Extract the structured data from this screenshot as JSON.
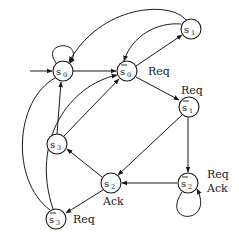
{
  "diagram": {
    "type": "state-transition-graph",
    "nodes": [
      {
        "id": "s0",
        "base": "s",
        "sub": "0",
        "bar": false,
        "x": 63,
        "y": 71
      },
      {
        "id": "s0bar",
        "base": "s",
        "sub": "0",
        "bar": true,
        "x": 127,
        "y": 71
      },
      {
        "id": "s1",
        "base": "s",
        "sub": "1",
        "bar": false,
        "x": 191,
        "y": 29
      },
      {
        "id": "s1bar",
        "base": "s",
        "sub": "1",
        "bar": true,
        "x": 189,
        "y": 107
      },
      {
        "id": "s3",
        "base": "s",
        "sub": "3",
        "bar": false,
        "x": 57,
        "y": 144
      },
      {
        "id": "s2",
        "base": "s",
        "sub": "2",
        "bar": false,
        "x": 111,
        "y": 183
      },
      {
        "id": "s2bar",
        "base": "s",
        "sub": "2",
        "bar": true,
        "x": 188,
        "y": 183
      },
      {
        "id": "s3bar",
        "base": "s",
        "sub": "3",
        "bar": true,
        "x": 56,
        "y": 219
      }
    ],
    "labels": {
      "s0bar_out": "Req",
      "s1bar_out": "Req",
      "s2_out": "Ack",
      "s2bar_out_1": "Req",
      "s2bar_out_2": "Ack",
      "s3bar_out": "Req"
    },
    "edges": [
      {
        "from": "start",
        "to": "s0"
      },
      {
        "from": "s0",
        "to": "s0",
        "kind": "self-loop"
      },
      {
        "from": "s0",
        "to": "s0bar"
      },
      {
        "from": "s1",
        "to": "s0",
        "kind": "curve"
      },
      {
        "from": "s1",
        "to": "s0bar",
        "kind": "curve"
      },
      {
        "from": "s0bar",
        "to": "s1"
      },
      {
        "from": "s0bar",
        "to": "s1bar"
      },
      {
        "from": "s1bar",
        "to": "s2"
      },
      {
        "from": "s1bar",
        "to": "s2bar"
      },
      {
        "from": "s2bar",
        "to": "s2"
      },
      {
        "from": "s2bar",
        "to": "s2bar",
        "kind": "self-loop"
      },
      {
        "from": "s2",
        "to": "s3"
      },
      {
        "from": "s2",
        "to": "s3bar"
      },
      {
        "from": "s3",
        "to": "s0"
      },
      {
        "from": "s3",
        "to": "s0bar"
      },
      {
        "from": "s3bar",
        "to": "s0",
        "kind": "curve"
      },
      {
        "from": "s3bar",
        "to": "s0bar",
        "kind": "curve"
      }
    ]
  }
}
